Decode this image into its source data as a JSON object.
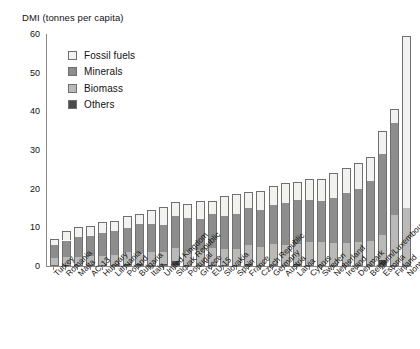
{
  "chart_data": {
    "type": "bar",
    "stacked": true,
    "title": "",
    "ylabel": "DMI (tonnes per capita)",
    "xlabel": "",
    "ylim": [
      0,
      60
    ],
    "yticks": [
      0,
      10,
      20,
      30,
      40,
      50,
      60
    ],
    "grid": false,
    "legend_position": "top-left",
    "series": [
      {
        "name": "Fossil fuels",
        "color": "#f2f2f0",
        "values": [
          1.6,
          2.4,
          2.7,
          2.6,
          2.8,
          2.6,
          3.0,
          2.5,
          3.8,
          4.6,
          3.7,
          3.6,
          4.6,
          3.4,
          5.2,
          5.2,
          4.3,
          5.1,
          4.7,
          5.0,
          4.8,
          5.3,
          5.8,
          6.6,
          6.4,
          6.9,
          6.2,
          5.9,
          3.6,
          44.5
        ]
      },
      {
        "name": "Minerals",
        "color": "#8d8d8d",
        "values": [
          3.2,
          4.2,
          5.2,
          5.0,
          5.9,
          6.2,
          6.3,
          7.5,
          7.2,
          7.0,
          8.2,
          8.6,
          8.0,
          8.8,
          8.5,
          9.1,
          9.5,
          9.4,
          10.3,
          10.9,
          11.2,
          11.0,
          10.5,
          11.6,
          13.0,
          13.6,
          15.4,
          20.9,
          23.7,
          0.0
        ]
      },
      {
        "name": "Biomass",
        "color": "#b9b9b7",
        "values": [
          2.0,
          2.2,
          2.1,
          2.5,
          2.4,
          2.6,
          3.2,
          3.0,
          3.3,
          3.3,
          3.5,
          3.6,
          3.8,
          4.3,
          4.2,
          4.1,
          5.0,
          4.7,
          5.3,
          5.2,
          5.4,
          5.9,
          6.0,
          5.6,
          5.6,
          5.9,
          6.2,
          6.5,
          12.9,
          14.7
        ]
      },
      {
        "name": "Others",
        "color": "#4b4b4b",
        "values": [
          0.2,
          0.2,
          0.2,
          0.2,
          0.3,
          0.2,
          0.4,
          0.4,
          0.3,
          0.4,
          1.2,
          0.3,
          0.3,
          0.3,
          0.3,
          0.3,
          0.4,
          0.3,
          0.3,
          0.3,
          0.4,
          0.3,
          0.3,
          0.3,
          0.3,
          0.3,
          0.3,
          1.6,
          0.3,
          0.3
        ]
      }
    ],
    "categories": [
      "Turkey",
      "Romania",
      "Malta",
      "AC-13",
      "Hungary",
      "Lithuania",
      "Poland",
      "Bulgaria",
      "Italy",
      "United Kingdom",
      "Slovak Republic",
      "Portugal",
      "Greece",
      "EU-15",
      "Slovakia",
      "Spain",
      "France",
      "Czech Republic",
      "Germany",
      "Austria",
      "Latvia",
      "Cyprus",
      "Sweden",
      "Netherland",
      "Ireland",
      "Denmark",
      "Belgium/Luxembourg",
      "Estonia",
      "Finland",
      "Norway"
    ],
    "totals": [
      7.0,
      9.0,
      10.2,
      10.3,
      11.4,
      11.6,
      12.9,
      13.4,
      14.6,
      15.3,
      16.6,
      16.1,
      16.7,
      16.8,
      18.2,
      18.7,
      19.2,
      19.5,
      20.6,
      21.4,
      21.8,
      22.5,
      22.6,
      24.1,
      25.3,
      26.7,
      28.1,
      34.9,
      40.5,
      59.5
    ]
  },
  "legend": {
    "items": [
      {
        "label": "Fossil fuels",
        "key": "fossil"
      },
      {
        "label": "Minerals",
        "key": "minerals"
      },
      {
        "label": "Biomass",
        "key": "biomass"
      },
      {
        "label": "Others",
        "key": "others"
      }
    ]
  }
}
